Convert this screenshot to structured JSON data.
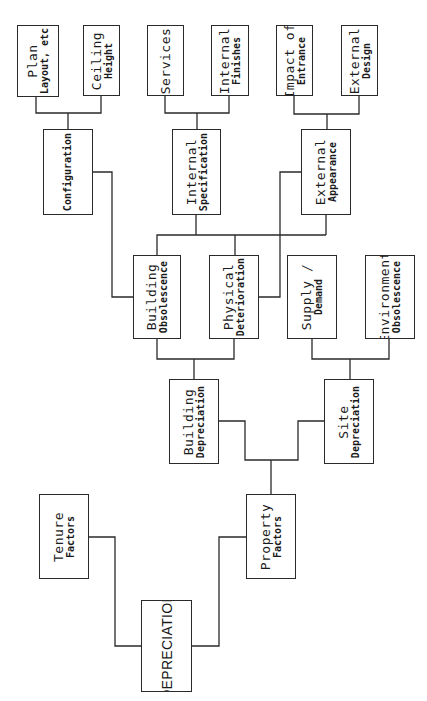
{
  "diagram": {
    "orientation": "rotated-90-ccw",
    "line_color": "#2a2a2a",
    "nodes": [
      {
        "id": "plan-layout",
        "line1": "Plan",
        "line2": "Layout, etc",
        "parent": "configuration",
        "box": [
          17,
          25,
          42,
          72
        ]
      },
      {
        "id": "ceiling-height",
        "line1": "Ceiling",
        "line2": "Height",
        "parent": "configuration",
        "box": [
          83,
          25,
          37,
          71
        ]
      },
      {
        "id": "services",
        "line1": "Services",
        "line2": "",
        "parent": "internal-specification",
        "box": [
          147,
          25,
          37,
          71
        ]
      },
      {
        "id": "internal-finishes",
        "line1": "Internal",
        "line2": "Finishes",
        "parent": "internal-specification",
        "box": [
          211,
          25,
          38,
          71
        ]
      },
      {
        "id": "impact-of-entrance",
        "line1": "Impact of",
        "line2": "Entrance",
        "parent": "external-appearance",
        "box": [
          276,
          25,
          37,
          71
        ]
      },
      {
        "id": "external-design",
        "line1": "External",
        "line2": "Design",
        "parent": "external-appearance",
        "box": [
          341,
          25,
          37,
          71
        ]
      },
      {
        "id": "configuration",
        "line1": "",
        "line2": "Configuration",
        "parent": "building-obsolescence",
        "box": [
          43,
          129,
          50,
          86
        ]
      },
      {
        "id": "internal-specification",
        "line1": "Internal",
        "line2": "Specification",
        "parent": "building-obsolescence+physical-deterioration",
        "box": [
          172,
          129,
          49,
          86
        ]
      },
      {
        "id": "external-appearance",
        "line1": "External",
        "line2": "Appearance",
        "parent": "building-obsolescence+physical-deterioration",
        "box": [
          301,
          129,
          50,
          86
        ]
      },
      {
        "id": "building-obsolescence",
        "line1": "Building",
        "line2": "Obsolescence",
        "parent": "building-depreciation",
        "box": [
          133,
          255,
          48,
          84
        ]
      },
      {
        "id": "physical-deterioration",
        "line1": "Physical",
        "line2": "Deterioration",
        "parent": "building-depreciation",
        "box": [
          209,
          255,
          50,
          84
        ]
      },
      {
        "id": "supply-demand",
        "line1": "Supply /",
        "line2": "Demand",
        "parent": "site-depreciation",
        "box": [
          287,
          255,
          50,
          84
        ]
      },
      {
        "id": "environment-obsolescence",
        "line1": "Environment",
        "line2": "Obsolescence",
        "parent": "site-depreciation",
        "box": [
          365,
          255,
          50,
          84
        ]
      },
      {
        "id": "building-depreciation",
        "line1": "Building",
        "line2": "Depreciation",
        "parent": "property-factors",
        "box": [
          169,
          379,
          50,
          85
        ]
      },
      {
        "id": "site-depreciation",
        "line1": "Site",
        "line2": "Depreciation",
        "parent": "property-factors",
        "box": [
          324,
          379,
          50,
          85
        ]
      },
      {
        "id": "tenure-factors",
        "line1": "Tenure",
        "line2": "Factors",
        "parent": "depreciation",
        "box": [
          39,
          494,
          50,
          85
        ]
      },
      {
        "id": "property-factors",
        "line1": "Property",
        "line2": "Factors",
        "parent": "depreciation",
        "box": [
          246,
          494,
          50,
          85
        ]
      },
      {
        "id": "depreciation",
        "line1": "DEPRECIATION",
        "line2": "",
        "parent": null,
        "box": [
          141,
          600,
          51,
          92
        ]
      }
    ]
  }
}
